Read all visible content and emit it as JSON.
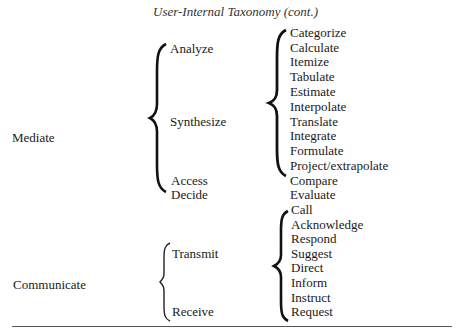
{
  "title": "User-Internal Taxonomy (cont.)",
  "groups": [
    {
      "label": "Mediate",
      "subgroups": [
        "Analyze",
        "Synthesize",
        "Access",
        "Decide"
      ],
      "actions": [
        "Categorize",
        "Calculate",
        "Itemize",
        "Tabulate",
        "Estimate",
        "Interpolate",
        "Translate",
        "Integrate",
        "Formulate",
        "Project/extrapolate",
        "Compare",
        "Evaluate"
      ]
    },
    {
      "label": "Communicate",
      "subgroups": [
        "Transmit",
        "Receive"
      ],
      "actions": [
        "Call",
        "Acknowledge",
        "Respond",
        "Suggest",
        "Direct",
        "Inform",
        "Instruct",
        "Request"
      ]
    }
  ]
}
